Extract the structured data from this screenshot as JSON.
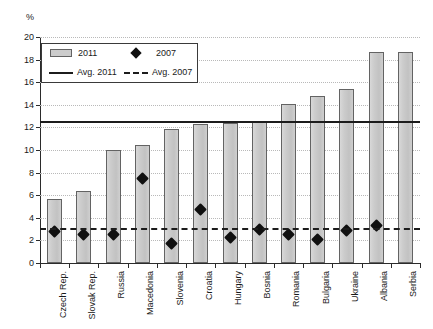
{
  "chart_data": {
    "type": "bar",
    "title": "",
    "subtitle": "",
    "xlabel": "",
    "ylabel": "%",
    "ylim": [
      0,
      20
    ],
    "ytick_step": 2,
    "yticks": [
      0,
      2,
      4,
      6,
      8,
      10,
      12,
      14,
      16,
      18,
      20
    ],
    "grid": true,
    "legend_position": "top-left",
    "categories": [
      "Czech Rep.",
      "Slovak Rep.",
      "Russia",
      "Macedonia",
      "Slovenia",
      "Croatia",
      "Hungary",
      "Bosnia",
      "Romania",
      "Bulgaria",
      "Ukraine",
      "Albania",
      "Serbia"
    ],
    "series": [
      {
        "name": "2011",
        "type": "bar",
        "values": [
          5.7,
          6.4,
          10.0,
          10.4,
          11.9,
          12.3,
          12.4,
          12.5,
          14.1,
          14.8,
          15.4,
          18.7,
          18.7
        ]
      },
      {
        "name": "2007",
        "type": "scatter",
        "marker": "diamond",
        "values": [
          2.75,
          2.5,
          2.5,
          7.45,
          1.75,
          4.75,
          2.25,
          2.95,
          2.5,
          2.05,
          2.9,
          3.3,
          null
        ]
      }
    ],
    "reference_lines": [
      {
        "name": "Avg. 2011",
        "value": 12.6,
        "style": "solid"
      },
      {
        "name": "Avg. 2007",
        "value": 3.1,
        "style": "dashed"
      }
    ],
    "colors": {
      "bar_fill": "#cccccc",
      "bar_border": "#636363",
      "marker": "#101010",
      "axis": "#2b2b2b",
      "grid": "#b9b9b9",
      "text": "#1a1a1a"
    }
  },
  "legend": {
    "entries": [
      {
        "label": "2011",
        "glyph": "bar-swatch"
      },
      {
        "label": "2007",
        "glyph": "diamond-marker"
      },
      {
        "label": "Avg. 2011",
        "glyph": "solid-line"
      },
      {
        "label": "Avg. 2007",
        "glyph": "dashed-line"
      }
    ]
  }
}
